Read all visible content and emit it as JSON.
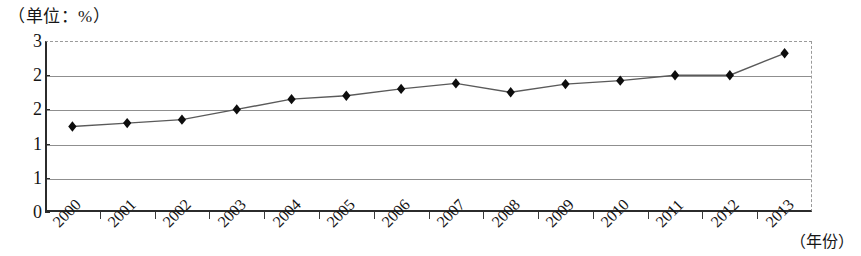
{
  "caption": {
    "unit_label": "（单位：%）"
  },
  "axes": {
    "x_axis_name": "（年份）",
    "y_ticks": [
      "3",
      "2",
      "2",
      "1",
      "1",
      "0"
    ],
    "x_ticks": [
      "2000",
      "2001",
      "2002",
      "2003",
      "2004",
      "2005",
      "2006",
      "2007",
      "2008",
      "2009",
      "2010",
      "2011",
      "2012",
      "2013"
    ]
  },
  "style": {
    "line_color": "#5a5a5a",
    "marker_color": "#0d0d0d",
    "grid_color": "#8f8f8f",
    "axis_color": "#2b2b2b",
    "frame_dash_color": "#9a9a9a"
  },
  "chart_data": {
    "type": "line",
    "title": "",
    "subtitle": "",
    "xlabel": "（年份）",
    "ylabel": "（单位：%）",
    "grid": true,
    "legend": null,
    "x": [
      "2000",
      "2001",
      "2002",
      "2003",
      "2004",
      "2005",
      "2006",
      "2007",
      "2008",
      "2009",
      "2010",
      "2011",
      "2012",
      "2013"
    ],
    "categories": [
      "2000",
      "2001",
      "2002",
      "2003",
      "2004",
      "2005",
      "2006",
      "2007",
      "2008",
      "2009",
      "2010",
      "2011",
      "2012",
      "2013"
    ],
    "values": [
      1.75,
      1.8,
      1.85,
      2.0,
      2.15,
      2.2,
      2.3,
      2.38,
      2.25,
      2.37,
      2.42,
      2.5,
      2.5,
      2.82
    ],
    "series": [
      {
        "name": "",
        "values": [
          1.75,
          1.8,
          1.85,
          2.0,
          2.15,
          2.2,
          2.3,
          2.38,
          2.25,
          2.37,
          2.42,
          2.5,
          2.5,
          2.82
        ],
        "marker": "diamond"
      }
    ],
    "ylim": [
      0.5,
      3.0
    ],
    "ytick_values": [
      3.0,
      2.5,
      2.0,
      1.5,
      1.0,
      0.5
    ],
    "ytick_labels": [
      "3",
      "2",
      "2",
      "1",
      "1",
      "0"
    ],
    "xlim": [
      0,
      14
    ],
    "annotations": []
  }
}
